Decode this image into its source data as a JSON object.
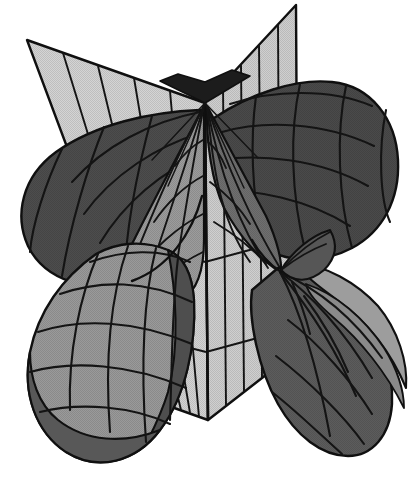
{
  "figure": {
    "kind": "3d-surface-illustration",
    "background_color": "#ffffff",
    "canvas": {
      "width": 409,
      "height": 482
    },
    "has_axis_labels": false,
    "has_legend": false,
    "has_caption": false,
    "visible_text": []
  },
  "palette": {
    "background": "#ffffff",
    "plane_fill": "#d2d2d2",
    "plane_fill_shadow": "#c4c4c4",
    "petal_dark": "#4a4a4a",
    "petal_mid": "#6e6e6e",
    "petal_light": "#9a9a9a",
    "petal_highlight": "#b5b5b5",
    "wedge_black": "#1c1c1c",
    "mesh_line": "#141414",
    "outline": "#101010"
  },
  "geometry": {
    "apex": {
      "x": 205,
      "y": 103
    },
    "lower_node": {
      "x": 281,
      "y": 272
    },
    "plane_fold_top": {
      "x": 205,
      "y": 103
    },
    "plane_fold_bottom": {
      "x": 208,
      "y": 420
    },
    "left_plane": {
      "name": "left-half-plane",
      "corners": [
        [
          27,
          40
        ],
        [
          205,
          103
        ],
        [
          208,
          420
        ],
        [
          163,
          404
        ]
      ],
      "grid_line_count": 5,
      "fill": "#d2d2d2"
    },
    "right_plane": {
      "name": "right-half-plane",
      "corners": [
        [
          205,
          103
        ],
        [
          296,
          5
        ],
        [
          298,
          350
        ],
        [
          208,
          420
        ]
      ],
      "grid_line_count": 5,
      "fill": "#cdcdcd"
    },
    "petals": [
      {
        "name": "petal-upper-left",
        "shade": "dark",
        "fill": "#4d4d4d",
        "center": [
          95,
          205
        ],
        "span_deg": [
          118,
          238
        ]
      },
      {
        "name": "petal-upper-right",
        "shade": "dark",
        "fill": "#4a4a4a",
        "center": [
          315,
          175
        ],
        "span_deg": [
          -62,
          58
        ]
      },
      {
        "name": "petal-lower-left",
        "shade": "light",
        "fill": "#9a9a9a",
        "center": [
          125,
          335
        ],
        "span_deg": [
          120,
          255
        ]
      },
      {
        "name": "petal-lower-right",
        "shade": "mixed",
        "fill": "#5a5a5a",
        "center": [
          330,
          330
        ],
        "span_deg": [
          -40,
          80
        ]
      }
    ],
    "funnels": [
      {
        "name": "funnel-left-upper",
        "from": [
          205,
          103
        ],
        "to": [
          120,
          255
        ],
        "fill": "#8f8f8f"
      },
      {
        "name": "funnel-right-upper",
        "from": [
          205,
          103
        ],
        "to": [
          281,
          272
        ],
        "fill": "#6a6a6a"
      },
      {
        "name": "funnel-lower-right",
        "from": [
          281,
          272
        ],
        "to": [
          340,
          330
        ],
        "fill": "#555555"
      }
    ],
    "top_wedge": {
      "name": "apex-dark-wedge",
      "points": [
        [
          163,
          83
        ],
        [
          205,
          103
        ],
        [
          248,
          78
        ],
        [
          205,
          63
        ]
      ],
      "fill": "#1c1c1c"
    }
  }
}
